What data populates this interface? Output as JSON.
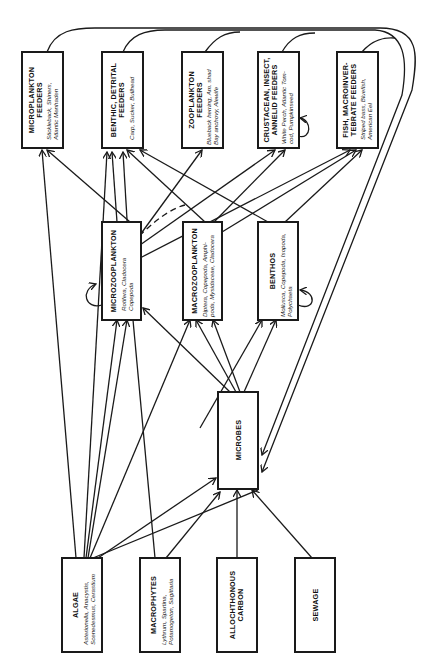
{
  "diagram": {
    "orientation": "rotated 90deg counter-clockwise",
    "consumers_top": [
      {
        "id": "microplankton-feeders",
        "title1": "MICROPLANKTON",
        "title2": "FEEDERS",
        "sub1": "Stickleback, Shiners,",
        "sub2": "Atlantic Menhaden"
      },
      {
        "id": "benthic-detrital-feeders",
        "title1": "BENTHIC, DETRITAL",
        "title2": "FEEDERS",
        "sub1": "Carp, Sucker, Bullhead",
        "sub2": ""
      },
      {
        "id": "zooplankton-feeders",
        "title1": "ZOOPLANKTON",
        "title2": "FEEDERS",
        "sub1": "Blueback herring, Am. shad",
        "sub2": "Bay anchovy, Alewife"
      },
      {
        "id": "crustacean-insect-annelid-feeders",
        "title1": "CRUSTACEAN, INSECT,",
        "title2": "ANNELID FEEDERS",
        "sub1": "White Perch, Atlantic Tom-",
        "sub2": "cod, Pumpkinseed"
      },
      {
        "id": "fish-macroinvertebrate-feeders",
        "title1": "FISH, MACROINVER-",
        "title2": "TEBRATE FEEDERS",
        "sub1": "Striped bass, Bluefish,",
        "sub2": "American Eel"
      }
    ],
    "consumers_middle": [
      {
        "id": "microzooplankton",
        "title1": "MICROZOOPLANKTON",
        "sub1": "Rotifera, Cladocera",
        "sub2": "Copepoda"
      },
      {
        "id": "macrozooplankton",
        "title1": "MACROZOOPLANKTON",
        "sub1": "Diptera, Copepoda, Amphi-",
        "sub2": "poda, Mysidaceae, Cladocera"
      },
      {
        "id": "benthos",
        "title1": "BENTHOS",
        "sub1": "Mollusca, Copepoda, Isopoda,",
        "sub2": "Polychaeta"
      }
    ],
    "microbes": {
      "title1": "MICROBES"
    },
    "sources": [
      {
        "id": "algae",
        "title1": "ALGAE",
        "sub1": "Asterionella, Anacystis,",
        "sub2": "Scenedesmus, Cerastium"
      },
      {
        "id": "macrophytes",
        "title1": "MACROPHYTES",
        "sub1": "Lythrum, Spartina,",
        "sub2": "Potamogeton, Sagittaria"
      },
      {
        "id": "allochthonous-carbon",
        "title1": "ALLOCHTHONOUS",
        "title2": "CARBON"
      },
      {
        "id": "sewage",
        "title1": "SEWAGE"
      }
    ]
  }
}
